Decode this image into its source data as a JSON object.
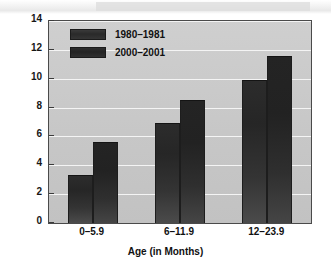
{
  "chart_data": {
    "type": "bar",
    "title": "",
    "subtitle": "",
    "xlabel": "Age (in Months)",
    "ylabel": "Percentage overweight",
    "categories": [
      "0–5.9",
      "6–11.9",
      "12–23.9"
    ],
    "series": [
      {
        "name": "1980–1981",
        "values": [
          3.3,
          6.9,
          9.9
        ],
        "color": "#2c2c2c"
      },
      {
        "name": "2000–2001",
        "values": [
          5.6,
          8.5,
          11.6
        ],
        "color": "#242424"
      }
    ],
    "ylim": [
      0,
      14
    ],
    "yticks": [
      0,
      2,
      4,
      6,
      8,
      10,
      12,
      14
    ],
    "ytick_labels": [
      "0",
      "2",
      "4",
      "6",
      "8",
      "10",
      "12",
      "14"
    ],
    "grid": "horizontal",
    "legend_position": "top-left-inside",
    "plot_background": "#c7c7c7",
    "gridline_color": "#f4f4f4",
    "axis_color": "#4a4a4a"
  }
}
